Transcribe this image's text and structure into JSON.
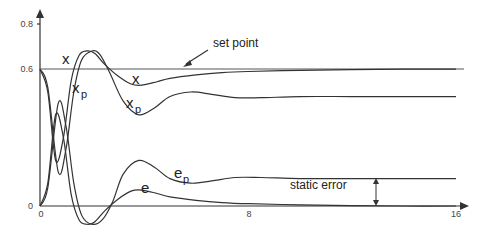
{
  "chart_data": {
    "type": "line",
    "title": "",
    "xlabel": "",
    "ylabel": "",
    "xlim": [
      0,
      16
    ],
    "ylim": [
      0,
      0.8
    ],
    "grid": false,
    "x_ticks": [
      "0",
      "8",
      "16"
    ],
    "y_ticks": [
      "0",
      "0.6",
      "0.8"
    ],
    "setpoint": 0.6,
    "series": [
      {
        "name": "x",
        "label": "x",
        "sub": "",
        "x": [
          0,
          0.3,
          0.6,
          0.9,
          1.2,
          1.5,
          1.8,
          2.1,
          2.5,
          3,
          3.5,
          3.9,
          4.5,
          5,
          6,
          7,
          8,
          10,
          12,
          14,
          16
        ],
        "y": [
          0.6,
          0.5,
          0.2,
          0.3,
          0.55,
          0.66,
          0.68,
          0.67,
          0.62,
          0.57,
          0.535,
          0.53,
          0.545,
          0.56,
          0.575,
          0.585,
          0.59,
          0.595,
          0.598,
          0.6,
          0.6
        ]
      },
      {
        "name": "xp",
        "label": "x",
        "sub": "p",
        "x": [
          0,
          0.3,
          0.7,
          1.0,
          1.3,
          1.6,
          2.0,
          2.3,
          2.7,
          3.2,
          3.8,
          4.4,
          5,
          5.8,
          6.6,
          7.5,
          8.5,
          10,
          12,
          14,
          16
        ],
        "y": [
          0.6,
          0.52,
          0.15,
          0.25,
          0.5,
          0.64,
          0.68,
          0.665,
          0.58,
          0.46,
          0.4,
          0.43,
          0.48,
          0.5,
          0.49,
          0.475,
          0.475,
          0.48,
          0.48,
          0.48,
          0.48
        ]
      },
      {
        "name": "ep",
        "label": "e",
        "sub": "p",
        "x": [
          0,
          0.3,
          0.7,
          1.0,
          1.3,
          1.6,
          2.0,
          2.4,
          2.8,
          3.2,
          3.8,
          4.4,
          5,
          5.8,
          6.6,
          7.5,
          8.5,
          10,
          12,
          14,
          16
        ],
        "y": [
          0,
          0.08,
          0.45,
          0.35,
          0.1,
          -0.04,
          -0.08,
          -0.06,
          0.02,
          0.14,
          0.2,
          0.17,
          0.12,
          0.1,
          0.11,
          0.125,
          0.125,
          0.12,
          0.12,
          0.12,
          0.12
        ]
      },
      {
        "name": "e",
        "label": "e",
        "sub": "",
        "x": [
          0,
          0.3,
          0.6,
          0.9,
          1.2,
          1.5,
          1.8,
          2.1,
          2.5,
          3,
          3.5,
          3.9,
          4.5,
          5,
          6,
          7,
          8,
          10,
          12,
          14,
          16
        ],
        "y": [
          0,
          0.1,
          0.4,
          0.3,
          0.05,
          -0.06,
          -0.08,
          -0.07,
          -0.02,
          0.03,
          0.065,
          0.07,
          0.055,
          0.04,
          0.025,
          0.015,
          0.01,
          0.005,
          0.002,
          0,
          0
        ]
      }
    ],
    "annotations": [
      {
        "text": "set point",
        "arrow_to": [
          5.4,
          0.6
        ]
      },
      {
        "text": "static error",
        "between": [
          0,
          0.12
        ],
        "at_x": 12.9
      }
    ]
  },
  "labels": {
    "y_0": "0",
    "y_06": "0.6",
    "y_08": "0.8",
    "x_0": "0",
    "x_8": "8",
    "x_16": "16",
    "set_point": "set point",
    "static_error": "static error",
    "x_main": "x",
    "x_p_main": "x",
    "x_p_sub": "p",
    "e_main": "e",
    "e_p_main": "e",
    "e_p_sub": "p"
  }
}
